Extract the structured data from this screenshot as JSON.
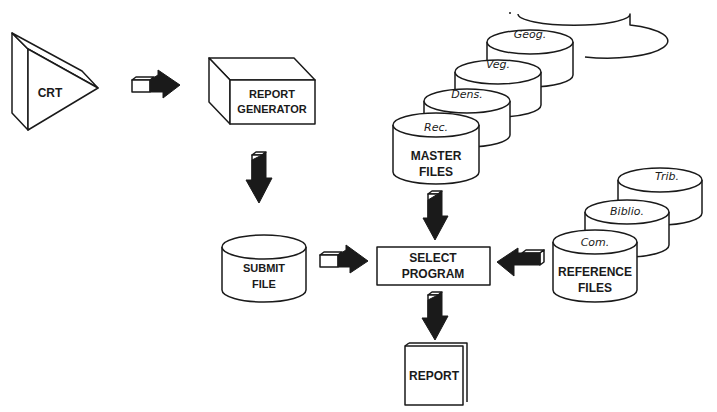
{
  "diagram": {
    "type": "flowchart",
    "nodes": {
      "crt": {
        "label": "CRT",
        "shape": "prism"
      },
      "report_generator": {
        "line1": "REPORT",
        "line2": "GENERATOR",
        "shape": "box-3d"
      },
      "submit_file": {
        "line1": "SUBMIT",
        "line2": "FILE",
        "shape": "cylinder"
      },
      "master_files": {
        "line1": "MASTER",
        "line2": "FILES",
        "shape": "cylinder-stack",
        "stack": [
          "Rec.",
          "Dens.",
          "Veg.",
          "Geog."
        ]
      },
      "select_program": {
        "line1": "SELECT",
        "line2": "PROGRAM",
        "shape": "rectangle"
      },
      "reference_files": {
        "line1": "REFERENCE",
        "line2": "FILES",
        "shape": "cylinder-stack",
        "stack": [
          "Com.",
          "Biblio.",
          "Trib."
        ]
      },
      "report": {
        "label": "REPORT",
        "shape": "document"
      }
    },
    "edges": [
      {
        "from": "CRT",
        "to": "REPORT GENERATOR",
        "direction": "right"
      },
      {
        "from": "REPORT GENERATOR",
        "to": "SUBMIT FILE",
        "direction": "down"
      },
      {
        "from": "SUBMIT FILE",
        "to": "SELECT PROGRAM",
        "direction": "right"
      },
      {
        "from": "MASTER FILES",
        "to": "SELECT PROGRAM",
        "direction": "down"
      },
      {
        "from": "REFERENCE FILES",
        "to": "SELECT PROGRAM",
        "direction": "left"
      },
      {
        "from": "SELECT PROGRAM",
        "to": "REPORT",
        "direction": "down"
      }
    ]
  }
}
